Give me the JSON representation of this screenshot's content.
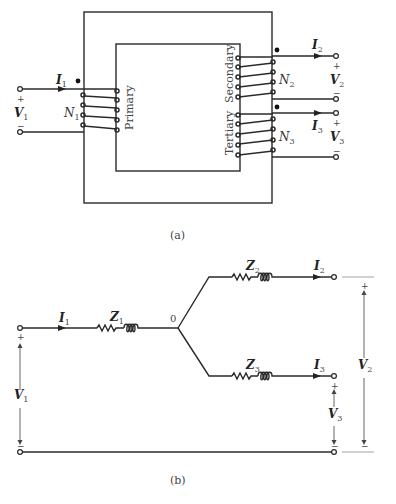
{
  "figure_a": {
    "caption": "(a)",
    "windings": [
      {
        "name": "Primary",
        "turns_label": "N",
        "turns_sub": "1",
        "current_label": "I",
        "current_sub": "1",
        "voltage_label": "V",
        "voltage_sub": "1"
      },
      {
        "name": "Secondary",
        "turns_label": "N",
        "turns_sub": "2",
        "current_label": "I",
        "current_sub": "2",
        "voltage_label": "V",
        "voltage_sub": "2"
      },
      {
        "name": "Tertiary",
        "turns_label": "N",
        "turns_sub": "3",
        "current_label": "I",
        "current_sub": "3",
        "voltage_label": "V",
        "voltage_sub": "3"
      }
    ],
    "plus": "+",
    "minus": "−"
  },
  "figure_b": {
    "caption": "(b)",
    "node_label": "0",
    "impedances": [
      {
        "label": "Z",
        "sub": "1"
      },
      {
        "label": "Z",
        "sub": "2"
      },
      {
        "label": "Z",
        "sub": "3"
      }
    ],
    "currents": [
      {
        "label": "I",
        "sub": "1"
      },
      {
        "label": "I",
        "sub": "2"
      },
      {
        "label": "I",
        "sub": "3"
      }
    ],
    "voltages": [
      {
        "label": "V",
        "sub": "1"
      },
      {
        "label": "V",
        "sub": "2"
      },
      {
        "label": "V",
        "sub": "3"
      }
    ],
    "plus": "+",
    "minus": "−"
  }
}
